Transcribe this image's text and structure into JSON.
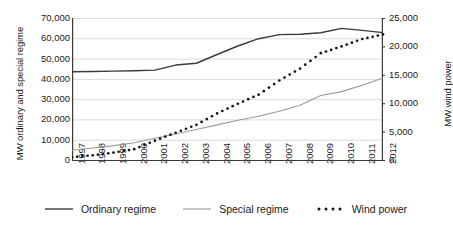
{
  "chart_data": {
    "type": "line",
    "title": "",
    "xlabel": "",
    "ylabel": "MW ordinary and special regime",
    "ylabel_secondary": "MW wind power",
    "grid": true,
    "legend_position": "bottom",
    "x": [
      1997,
      1998,
      1999,
      2000,
      2001,
      2002,
      2003,
      2004,
      2005,
      2006,
      2007,
      2008,
      2009,
      2010,
      2011,
      2012
    ],
    "xtick_labels": [
      "1997",
      "1998",
      "1999",
      "2000",
      "2001",
      "2002",
      "2003",
      "2004",
      "2005",
      "2006",
      "2007",
      "2008",
      "2009",
      "2010",
      "2011",
      "2012"
    ],
    "ylim": [
      0,
      70000
    ],
    "ytick_labels": [
      "70,000",
      "60,000",
      "50,000",
      "40,000",
      "30,000",
      "20,000",
      "10,000",
      "0"
    ],
    "ytick_values": [
      70000,
      60000,
      50000,
      40000,
      30000,
      20000,
      10000,
      0
    ],
    "ylim_secondary": [
      0,
      25000
    ],
    "ytick_labels_secondary": [
      "25,000",
      "20,000",
      "15,000",
      "10,000",
      "5,000",
      "0"
    ],
    "ytick_values_secondary": [
      25000,
      20000,
      15000,
      10000,
      5000,
      0
    ],
    "series": [
      {
        "name": "Ordinary regime",
        "axis": "left",
        "style": "solid",
        "color": "#3b3b3b",
        "values": [
          43500,
          43600,
          43800,
          44000,
          44300,
          46800,
          47700,
          52000,
          56200,
          59800,
          61800,
          62000,
          62700,
          64900,
          63900,
          62800
        ]
      },
      {
        "name": "Special regime",
        "axis": "left",
        "style": "solid",
        "color": "#9a9a9a",
        "values": [
          4800,
          5900,
          7100,
          8500,
          10700,
          12800,
          15000,
          17300,
          19600,
          21600,
          24000,
          27000,
          31800,
          33700,
          36800,
          40400
        ]
      },
      {
        "name": "Wind power",
        "axis": "right",
        "style": "dotted",
        "color": "#141414",
        "values": [
          500,
          830,
          1300,
          1900,
          3400,
          4800,
          6200,
          8200,
          9900,
          11500,
          14000,
          16100,
          18800,
          20000,
          21300,
          22100
        ]
      }
    ],
    "legend": [
      {
        "label": "Ordinary regime",
        "style": "solid",
        "color": "#3b3b3b"
      },
      {
        "label": "Special regime",
        "style": "solid",
        "color": "#9a9a9a"
      },
      {
        "label": "Wind power",
        "style": "dotted",
        "color": "#141414"
      }
    ]
  }
}
